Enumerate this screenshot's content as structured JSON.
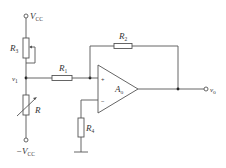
{
  "diagram": {
    "type": "op-amp non-inverting amplifier circuit with thermistor divider",
    "labels": {
      "vcc": {
        "main": "V",
        "sub": "CC",
        "prefix": ""
      },
      "neg_vcc": {
        "main": "V",
        "sub": "CC",
        "prefix": "−"
      },
      "r3": {
        "main": "R",
        "sub": "3"
      },
      "v1": {
        "main": "v",
        "sub": "1"
      },
      "r1": {
        "main": "R",
        "sub": "1"
      },
      "r2": {
        "main": "R",
        "sub": "2"
      },
      "opamp": {
        "main": "A",
        "sub": "o"
      },
      "vo": {
        "main": "v",
        "sub": "o"
      },
      "r": {
        "main": "R",
        "sub": ""
      },
      "r4": {
        "main": "R",
        "sub": "4"
      },
      "plus": "+",
      "minus": "−"
    },
    "components": [
      {
        "id": "R3",
        "kind": "potentiometer (rheostat)"
      },
      {
        "id": "R",
        "kind": "variable resistor (thermistor)"
      },
      {
        "id": "R1",
        "kind": "resistor"
      },
      {
        "id": "R2",
        "kind": "resistor (feedback)"
      },
      {
        "id": "R4",
        "kind": "resistor (to ground)"
      },
      {
        "id": "Ao",
        "kind": "operational amplifier"
      }
    ]
  }
}
